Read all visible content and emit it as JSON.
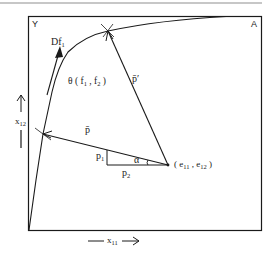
{
  "diagram": {
    "type": "edgeworth-box-efficiency-frontier",
    "corners": {
      "top_left": "Y",
      "top_right": "A"
    },
    "axes": {
      "x_label": "x",
      "x_sub": "11",
      "y_label": "x",
      "y_sub": "12"
    },
    "labels": {
      "gradient": "Df",
      "gradient_sub": "1",
      "region": "θ ( f",
      "region_sub1": "1",
      "region_mid": " , f",
      "region_sub2": "2",
      "region_end": " )",
      "price_vector": "p̄",
      "price_vector_prime": "p̄′",
      "p1": "p",
      "p1_sub": "1",
      "p2": "p",
      "p2_sub": "2",
      "angle": "α",
      "endowment_open": "( e",
      "endowment_sub1": "11",
      "endowment_mid": " , e",
      "endowment_sub2": "12",
      "endowment_close": " )"
    },
    "points": {
      "endowment": [
        168,
        165
      ],
      "tangency_lower": [
        43,
        134
      ],
      "tangency_upper": [
        108,
        31
      ]
    },
    "colors": {
      "line": "#1a1a1a",
      "top_rule": "#b5b5b5"
    }
  }
}
